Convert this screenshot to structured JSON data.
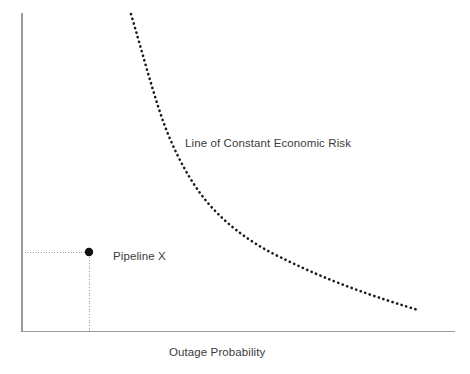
{
  "figure": {
    "background_color": "#ffffff",
    "width": 470,
    "height": 374
  },
  "labels": {
    "curve_label": "Line of Constant Economic Risk",
    "point_label": "Pipeline X",
    "x_axis_label": "Outage Probability",
    "y_axis_label": ""
  },
  "colors": {
    "axis": "#9a9a9a",
    "curve": "#1b1b1b",
    "guide": "#9b9b9b",
    "marker": "#111111",
    "text": "#3b3b3b"
  },
  "chart_data": {
    "type": "line",
    "title": "",
    "subtitle": "",
    "xlabel": "Outage Probability",
    "ylabel": "",
    "grid": false,
    "legend": "none",
    "axis_style": {
      "x_ticks": [],
      "y_ticks": [],
      "x_tick_labels": [],
      "y_tick_labels": [],
      "spines": [
        "left",
        "bottom"
      ],
      "xlim": [
        0,
        1
      ],
      "ylim": [
        0,
        1
      ]
    },
    "series": [
      {
        "name": "Line of Constant Economic Risk",
        "style": "dotted",
        "annotation": "Line of Constant Economic Risk",
        "description": "Hyperbolic iso-risk curve: consequence x probability = constant",
        "x": [
          0.252,
          0.268,
          0.29,
          0.318,
          0.352,
          0.395,
          0.447,
          0.505,
          0.568,
          0.634,
          0.704,
          0.776,
          0.85,
          0.925,
          1.0
        ],
        "y": [
          1.0,
          0.94,
          0.862,
          0.778,
          0.695,
          0.613,
          0.535,
          0.467,
          0.408,
          0.357,
          0.313,
          0.275,
          0.242,
          0.213,
          0.188
        ]
      }
    ],
    "points": [
      {
        "name": "Pipeline X",
        "annotation": "Pipeline X",
        "x": 0.155,
        "y": 0.248,
        "marker": "filled-circle",
        "guides": [
          "horizontal-to-y-axis",
          "vertical-to-x-axis"
        ]
      }
    ],
    "annotations": [
      {
        "text": "Line of Constant Economic Risk",
        "x": 0.377,
        "y": 0.589
      },
      {
        "text": "Pipeline X",
        "x": 0.21,
        "y": 0.25
      }
    ]
  },
  "geometry": {
    "axis": {
      "y_axis_x": 22,
      "y_axis_top": 13,
      "y_axis_bottom": 331.5,
      "x_axis_y": 331.5,
      "x_axis_left": 22,
      "x_axis_right": 455
    },
    "curve_path": "M 131 14 C 141 48, 149 78, 158 106 C 168 138, 182 168, 200 193 C 220 220, 248 242, 282 258 C 316 275, 358 292, 418 310",
    "marker": {
      "cx": 89,
      "cy": 252,
      "r": 4.2
    },
    "guides": {
      "horizontal": {
        "x1": 22,
        "y1": 252,
        "x2": 89,
        "y2": 252
      },
      "vertical": {
        "x1": 89,
        "y1": 252,
        "x2": 89,
        "y2": 331
      }
    }
  }
}
